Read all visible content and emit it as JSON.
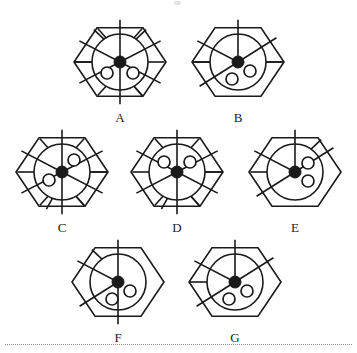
{
  "page": {
    "background_color": "#ffffff",
    "stroke_color": "#1a1a1a",
    "hub_color": "#1a1a1a",
    "pip_fill_color": "#ffffff",
    "width": 357,
    "height": 353
  },
  "separator": {
    "style": "dotted",
    "color": "#8a8a8a"
  },
  "figures": [
    {
      "label": "A",
      "center_x": 120,
      "center_y": 62,
      "hex_radius": 46,
      "circle_radius": 28,
      "hub_radius": 6,
      "spoke_angles_deg": [
        0,
        60,
        120,
        180,
        240,
        300
      ],
      "ring_chord_angles_deg": [
        30,
        90,
        150,
        210,
        270,
        330
      ],
      "pips": [
        {
          "x": -13,
          "y": 11,
          "r": 6
        },
        {
          "x": 13,
          "y": 11,
          "r": 6
        }
      ],
      "outer_spurs_deg": [
        35,
        150,
        325
      ],
      "stem_angle_deg": 270
    },
    {
      "label": "B",
      "center_x": 238,
      "center_y": 62,
      "hex_radius": 46,
      "circle_radius": 28,
      "hub_radius": 6,
      "spoke_angles_deg": [
        0,
        55,
        235,
        300
      ],
      "ring_chord_angles_deg": [
        90,
        270
      ],
      "pips": [
        {
          "x": -6,
          "y": 17,
          "r": 6
        },
        {
          "x": 12,
          "y": 9,
          "r": 6
        }
      ],
      "outer_spurs_deg": [
        90
      ],
      "stem_angle_deg": 270
    },
    {
      "label": "C",
      "center_x": 62,
      "center_y": 172,
      "hex_radius": 46,
      "circle_radius": 28,
      "hub_radius": 6,
      "spoke_angles_deg": [
        0,
        60,
        120,
        180,
        240,
        300
      ],
      "ring_chord_angles_deg": [
        30,
        90,
        150,
        210,
        270,
        330
      ],
      "pips": [
        {
          "x": 12,
          "y": -12,
          "r": 6
        },
        {
          "x": -13,
          "y": 8,
          "r": 6
        }
      ],
      "outer_spurs_deg": [
        150,
        200
      ],
      "stem_angle_deg": 90
    },
    {
      "label": "D",
      "center_x": 177,
      "center_y": 172,
      "hex_radius": 46,
      "circle_radius": 28,
      "hub_radius": 6,
      "spoke_angles_deg": [
        0,
        60,
        120,
        180,
        240,
        300
      ],
      "ring_chord_angles_deg": [
        30,
        90,
        150,
        210,
        270,
        330
      ],
      "pips": [
        {
          "x": -13,
          "y": -10,
          "r": 6
        },
        {
          "x": 13,
          "y": -10,
          "r": 6
        }
      ],
      "outer_spurs_deg": [
        150,
        200
      ],
      "stem_angle_deg": 90
    },
    {
      "label": "E",
      "center_x": 295,
      "center_y": 172,
      "hex_radius": 46,
      "circle_radius": 28,
      "hub_radius": 6,
      "spoke_angles_deg": [
        0,
        55,
        235,
        300
      ],
      "ring_chord_angles_deg": [
        270
      ],
      "pips": [
        {
          "x": 13,
          "y": -9,
          "r": 6
        },
        {
          "x": 13,
          "y": 9,
          "r": 6
        }
      ],
      "outer_spurs_deg": [
        35
      ],
      "stem_angle_deg": null
    },
    {
      "label": "F",
      "center_x": 118,
      "center_y": 282,
      "hex_radius": 46,
      "circle_radius": 28,
      "hub_radius": 6,
      "spoke_angles_deg": [
        0,
        180,
        235,
        300
      ],
      "ring_chord_angles_deg": [],
      "pips": [
        {
          "x": -6,
          "y": 17,
          "r": 6
        },
        {
          "x": 12,
          "y": 9,
          "r": 6
        }
      ],
      "outer_spurs_deg": [
        325
      ],
      "stem_angle_deg": null
    },
    {
      "label": "G",
      "center_x": 235,
      "center_y": 282,
      "hex_radius": 46,
      "circle_radius": 28,
      "hub_radius": 6,
      "spoke_angles_deg": [
        0,
        55,
        235,
        300
      ],
      "ring_chord_angles_deg": [],
      "pips": [
        {
          "x": -6,
          "y": 17,
          "r": 6
        },
        {
          "x": 12,
          "y": 9,
          "r": 6
        }
      ],
      "outer_spurs_deg": [],
      "stem_angle_deg": 270
    }
  ]
}
